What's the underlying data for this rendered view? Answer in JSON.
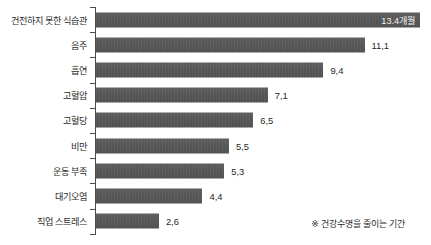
{
  "chart_data": {
    "type": "bar",
    "orientation": "horizontal",
    "title": "",
    "xlabel": "",
    "ylabel": "",
    "unit": "개월",
    "xlim": [
      0,
      13.6
    ],
    "grid": false,
    "legend": "none",
    "decimal_separator": ",",
    "categories": [
      "건전하지 못한 식습관",
      "음주",
      "흡연",
      "고혈압",
      "고혈당",
      "비만",
      "운동 부족",
      "대기오염",
      "직업 스트레스"
    ],
    "values": [
      13.4,
      11.1,
      9.4,
      7.1,
      6.5,
      5.5,
      5.3,
      4.4,
      2.6
    ],
    "value_labels": [
      "13.4개월",
      "11,1",
      "9,4",
      "7,1",
      "6,5",
      "5,5",
      "5,3",
      "4,4",
      "2,6"
    ],
    "label_placement": [
      "inside",
      "outside",
      "outside",
      "outside",
      "outside",
      "outside",
      "outside",
      "outside",
      "outside"
    ],
    "bar_color": "#565656",
    "inside_label_color": "#f2f2f2",
    "outside_label_color": "#1f1f1f",
    "axis_color": "#4a4a4a",
    "background_color": "#ffffff"
  },
  "footnote": {
    "text": "※ 건강수명을 줄이는 기간"
  }
}
